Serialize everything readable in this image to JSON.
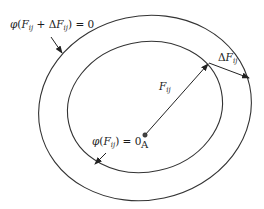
{
  "diagram": {
    "outer_curve": {
      "label_phi": "φ",
      "label_open": "(",
      "label_F": "F",
      "label_sub": "ij",
      "label_plus": " + Δ",
      "label_F2": "F",
      "label_sub2": "ij",
      "label_close": ") = 0"
    },
    "inner_curve": {
      "label_phi": "φ",
      "label_open": "(",
      "label_F": "F",
      "label_sub": "ij",
      "label_close": ") = 0"
    },
    "vector_F": {
      "symbol": "F",
      "sub": "ij"
    },
    "vector_dF": {
      "prefix": "Δ",
      "symbol": "F",
      "sub": "ij"
    },
    "point": {
      "label": "A"
    },
    "colors": {
      "stroke": "#333333",
      "text": "#1a1a1a",
      "background": "#ffffff"
    }
  }
}
